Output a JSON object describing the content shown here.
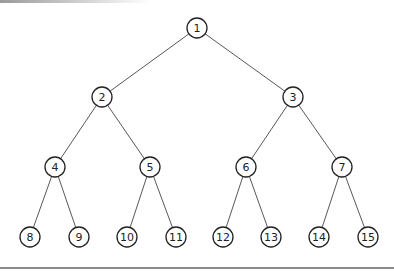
{
  "diagram": {
    "type": "binary-tree",
    "nodes": [
      {
        "id": "1",
        "label": "1",
        "x": 197,
        "y": 28
      },
      {
        "id": "2",
        "label": "2",
        "x": 102,
        "y": 97
      },
      {
        "id": "3",
        "label": "3",
        "x": 293,
        "y": 97
      },
      {
        "id": "4",
        "label": "4",
        "x": 55,
        "y": 167
      },
      {
        "id": "5",
        "label": "5",
        "x": 150,
        "y": 167
      },
      {
        "id": "6",
        "label": "6",
        "x": 246,
        "y": 167
      },
      {
        "id": "7",
        "label": "7",
        "x": 342,
        "y": 167
      },
      {
        "id": "8",
        "label": "8",
        "x": 30,
        "y": 237
      },
      {
        "id": "9",
        "label": "9",
        "x": 79,
        "y": 237
      },
      {
        "id": "10",
        "label": "10",
        "x": 127,
        "y": 237
      },
      {
        "id": "11",
        "label": "11",
        "x": 176,
        "y": 237
      },
      {
        "id": "12",
        "label": "12",
        "x": 223,
        "y": 237
      },
      {
        "id": "13",
        "label": "13",
        "x": 271,
        "y": 237
      },
      {
        "id": "14",
        "label": "14",
        "x": 319,
        "y": 237
      },
      {
        "id": "15",
        "label": "15",
        "x": 368,
        "y": 237
      }
    ],
    "edges": [
      [
        "1",
        "2"
      ],
      [
        "1",
        "3"
      ],
      [
        "2",
        "4"
      ],
      [
        "2",
        "5"
      ],
      [
        "3",
        "6"
      ],
      [
        "3",
        "7"
      ],
      [
        "4",
        "8"
      ],
      [
        "4",
        "9"
      ],
      [
        "5",
        "10"
      ],
      [
        "5",
        "11"
      ],
      [
        "6",
        "12"
      ],
      [
        "6",
        "13"
      ],
      [
        "7",
        "14"
      ],
      [
        "7",
        "15"
      ]
    ],
    "node_radius": 10
  }
}
